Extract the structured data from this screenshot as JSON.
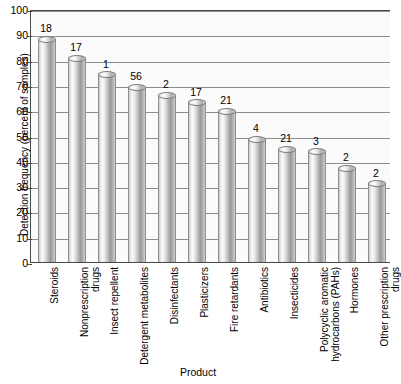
{
  "chart_data": {
    "type": "bar",
    "title": "",
    "xlabel": "Product",
    "ylabel": "Detection frequency (percent of samples)",
    "ylim": [
      0,
      100
    ],
    "yticks": [
      0,
      10,
      20,
      30,
      40,
      50,
      60,
      70,
      80,
      90,
      100
    ],
    "grid": true,
    "legend": "none",
    "categories": [
      "Steroids",
      "Nonprescription drugs",
      "Insect repellent",
      "Detergent metabolites",
      "Disinfectants",
      "Plasticizers",
      "Fire retardants",
      "Antibiotics",
      "Insecticides",
      "Polycyclic aromatic hydrocarbons (PAHs)",
      "Hormones",
      "Other prescription drugs"
    ],
    "category_lines": [
      [
        "Steroids"
      ],
      [
        "Nonprescription",
        "drugs"
      ],
      [
        "Insect repellent"
      ],
      [
        "Detergent metabolites"
      ],
      [
        "Disinfectants"
      ],
      [
        "Plasticizers"
      ],
      [
        "Fire retardants"
      ],
      [
        "Antibiotics"
      ],
      [
        "Insecticides"
      ],
      [
        "Polycyclic aromatic",
        "hydrocarbons (PAHs)"
      ],
      [
        "Hormones"
      ],
      [
        "Other prescription",
        "drugs"
      ]
    ],
    "values": [
      88,
      80.5,
      74,
      69,
      66,
      63,
      59.5,
      48.5,
      44.5,
      43.5,
      37,
      31
    ],
    "point_labels": [
      "18",
      "17",
      "1",
      "56",
      "2",
      "17",
      "21",
      "4",
      "21",
      "3",
      "2",
      "2"
    ]
  }
}
